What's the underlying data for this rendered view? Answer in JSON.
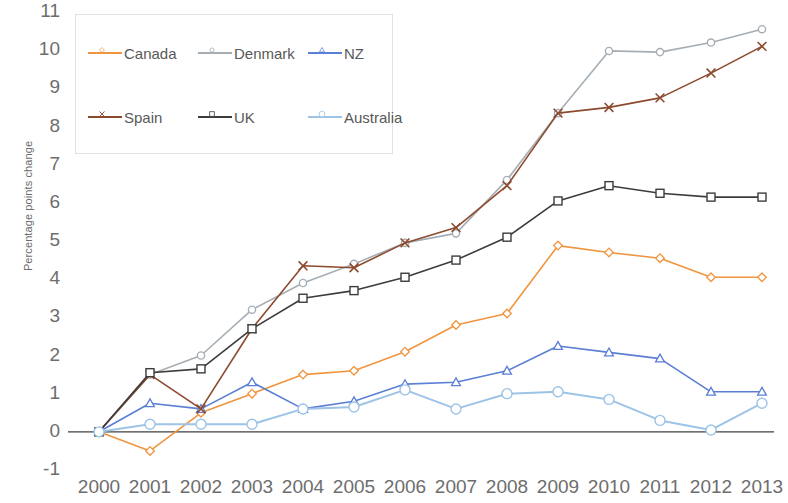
{
  "chart_data": {
    "type": "line",
    "title": "",
    "xlabel": "",
    "ylabel": "Percentage points change",
    "categories": [
      "2000",
      "2001",
      "2002",
      "2003",
      "2004",
      "2005",
      "2006",
      "2007",
      "2008",
      "2009",
      "2010",
      "2011",
      "2012",
      "2013"
    ],
    "x": [
      2000,
      2001,
      2002,
      2003,
      2004,
      2005,
      2006,
      2007,
      2008,
      2009,
      2010,
      2011,
      2012,
      2013
    ],
    "ylim": [
      -1,
      11
    ],
    "xlim": [
      2000,
      2013
    ],
    "y_ticks": [
      -1,
      0,
      1,
      2,
      3,
      4,
      5,
      6,
      7,
      8,
      9,
      10,
      11
    ],
    "grid": false,
    "legend_position": "top-left",
    "zero_line": true,
    "series": [
      {
        "name": "Canada",
        "color": "#F0953F",
        "marker": "diamond",
        "values": [
          0.0,
          -0.5,
          0.5,
          1.0,
          1.5,
          1.6,
          2.1,
          2.8,
          3.1,
          4.88,
          4.7,
          4.55,
          4.05,
          4.05
        ]
      },
      {
        "name": "Denmark",
        "color": "#A6AEB5",
        "marker": "circle",
        "values": [
          0.0,
          1.5,
          2.0,
          3.2,
          3.9,
          4.4,
          4.95,
          5.2,
          6.6,
          8.35,
          9.98,
          9.95,
          10.2,
          10.55
        ]
      },
      {
        "name": "NZ",
        "color": "#5B7FD4",
        "marker": "triangle",
        "values": [
          0.0,
          0.75,
          0.6,
          1.3,
          0.6,
          0.8,
          1.25,
          1.3,
          1.6,
          2.25,
          2.08,
          1.92,
          1.05,
          1.05
        ]
      },
      {
        "name": "Spain",
        "color": "#8C4A2F",
        "marker": "cross",
        "values": [
          0.0,
          1.5,
          0.6,
          2.7,
          4.35,
          4.3,
          4.95,
          5.35,
          6.45,
          8.35,
          8.5,
          8.75,
          9.4,
          10.1
        ]
      },
      {
        "name": "UK",
        "color": "#3C3C3C",
        "marker": "square",
        "values": [
          0.0,
          1.55,
          1.65,
          2.7,
          3.5,
          3.7,
          4.05,
          4.5,
          5.1,
          6.05,
          6.45,
          6.25,
          6.15,
          6.15
        ]
      },
      {
        "name": "Australia",
        "color": "#9DC3E6",
        "marker": "circle-open",
        "values": [
          0.0,
          0.2,
          0.2,
          0.2,
          0.6,
          0.65,
          1.1,
          0.6,
          1.0,
          1.05,
          0.85,
          0.3,
          0.05,
          0.75
        ]
      }
    ]
  },
  "legend": {
    "items": [
      {
        "label": "Canada"
      },
      {
        "label": "Denmark"
      },
      {
        "label": "NZ"
      },
      {
        "label": "Spain"
      },
      {
        "label": "UK"
      },
      {
        "label": "Australia"
      }
    ]
  },
  "axes": {
    "y_title": "Percentage points change",
    "y_tick_labels": [
      "11",
      "10",
      "9",
      "8",
      "7",
      "6",
      "5",
      "4",
      "3",
      "2",
      "1",
      "0",
      "-1"
    ],
    "x_tick_labels": [
      "2000",
      "2001",
      "2002",
      "2003",
      "2004",
      "2005",
      "2006",
      "2007",
      "2008",
      "2009",
      "2010",
      "2011",
      "2012",
      "2013"
    ]
  }
}
